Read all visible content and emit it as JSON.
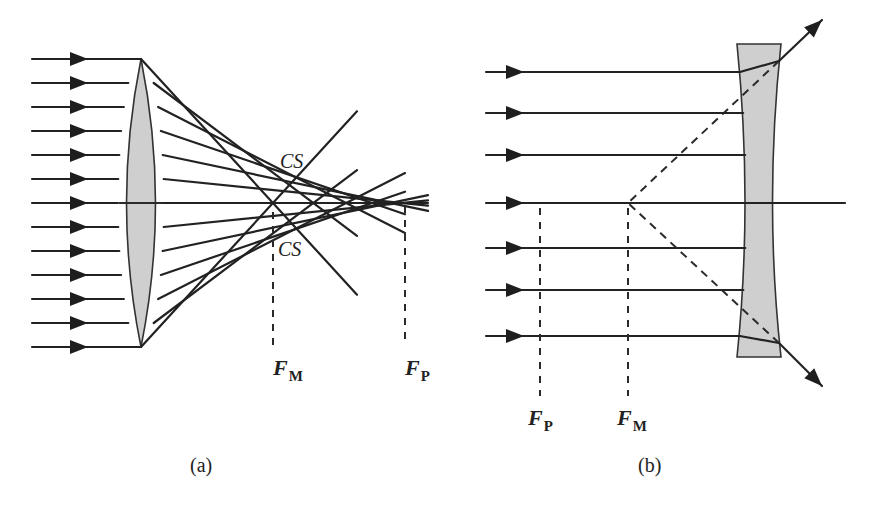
{
  "figure": {
    "panel_a": {
      "caption": "(a)",
      "description": "Converging lens with spherical aberration",
      "caustic_label_top": "CS",
      "caustic_label_bottom": "CS",
      "focus_marginal": {
        "letter": "F",
        "sub": "M"
      },
      "focus_paraxial": {
        "letter": "F",
        "sub": "P"
      },
      "ray_count": 13
    },
    "panel_b": {
      "caption": "(b)",
      "description": "Diverging lens with spherical aberration",
      "focus_paraxial": {
        "letter": "F",
        "sub": "P"
      },
      "focus_marginal": {
        "letter": "F",
        "sub": "M"
      },
      "ray_count": 7
    },
    "colors": {
      "line": "#222222",
      "lens_fill": "#cfcfcf",
      "background": "#ffffff"
    }
  }
}
